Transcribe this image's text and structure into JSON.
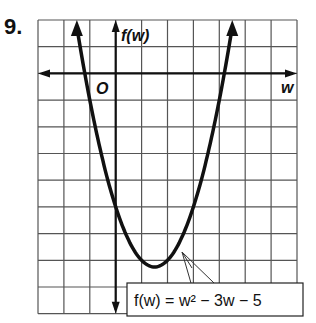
{
  "problem_number": "9.",
  "chart_data": {
    "type": "line",
    "title": "",
    "xlabel": "w",
    "ylabel": "f(w)",
    "origin_label": "O",
    "function": "f(w) = w^2 - 3w - 5",
    "label_text": "f(w) = w² − 3w − 5",
    "grid": true,
    "xlim": [
      -3,
      7
    ],
    "ylim": [
      -9,
      2
    ],
    "x": [
      -1.9,
      -1,
      0,
      1,
      1.5,
      2,
      3,
      4,
      4.9
    ],
    "values": [
      6.31,
      -1,
      -5,
      -7,
      -7.25,
      -7,
      -5,
      -1,
      4.31
    ],
    "vertex": [
      1.5,
      -7.25
    ],
    "y_intercept": -5
  }
}
